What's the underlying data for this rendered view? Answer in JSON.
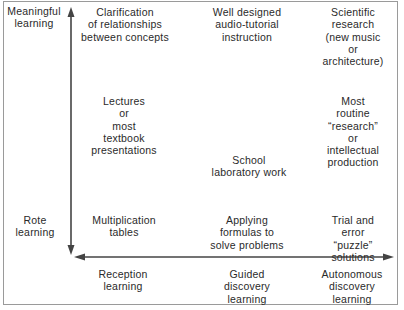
{
  "diagram": {
    "type": "two-axis conceptual grid",
    "vertical_axis": {
      "top_label": "Meaningful\nlearning",
      "bottom_label": "Rote\nlearning",
      "direction": "bidirectional"
    },
    "horizontal_axis": {
      "labels": [
        "Reception\nlearning",
        "Guided\ndiscovery\nlearning",
        "Autonomous\ndiscovery\nlearning"
      ],
      "direction": "bidirectional"
    },
    "cells": {
      "top_left": "Clarification\nof relationships\nbetween concepts",
      "top_center": "Well designed\naudio-tutorial\ninstruction",
      "top_right": "Scientific\nresearch\n(new music or\narchitecture)",
      "middle_left": "Lectures\nor\nmost\ntextbook\npresentations",
      "middle_center": "School\nlaboratory work",
      "middle_right": "Most routine\n“research” or\nintellectual\nproduction",
      "bottom_left": "Multiplication\ntables",
      "bottom_center": "Applying\nformulas to\nsolve problems",
      "bottom_right": "Trial and error\n“puzzle” solutions"
    },
    "colors": {
      "ink": "#2a2a2a",
      "axis": "#444444",
      "border": "#9a9a9a",
      "background": "#ffffff"
    }
  }
}
